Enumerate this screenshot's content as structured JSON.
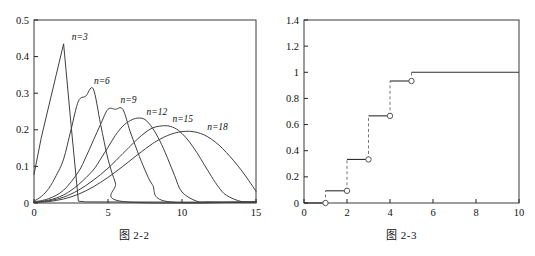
{
  "figures": [
    {
      "id": "fig-2-2",
      "caption": "图 2-2"
    },
    {
      "id": "fig-2-3",
      "caption": "图 2-3"
    }
  ],
  "chart_data": [
    {
      "type": "line",
      "title": "图 2-2",
      "xlabel": "",
      "ylabel": "",
      "xlim": [
        0,
        15
      ],
      "ylim": [
        0,
        0.5
      ],
      "xticks": [
        0,
        5,
        10,
        15
      ],
      "xtick_labels": [
        "0",
        "5",
        "10",
        "15"
      ],
      "yticks": [
        0,
        0.1,
        0.2,
        0.3,
        0.4,
        0.5
      ],
      "ytick_labels": [
        "0",
        "0.1",
        "0.2",
        "0.3",
        "0.4",
        "0.5"
      ],
      "grid": false,
      "legend": "inline-annotations",
      "annotations": [
        {
          "text": "n=3",
          "x": 2.55,
          "y": 0.445
        },
        {
          "text": "n=6",
          "x": 4.05,
          "y": 0.325
        },
        {
          "text": "n=9",
          "x": 5.85,
          "y": 0.272
        },
        {
          "text": "n=12",
          "x": 7.6,
          "y": 0.241
        },
        {
          "text": "n=15",
          "x": 9.35,
          "y": 0.221
        },
        {
          "text": "n=18",
          "x": 11.7,
          "y": 0.2
        }
      ],
      "series": [
        {
          "name": "n=3",
          "x": [
            0,
            0.5,
            1,
            1.5,
            2,
            2.5,
            3,
            3.5,
            15
          ],
          "values": [
            0.078,
            0.18,
            0.265,
            0.35,
            0.435,
            0.215,
            0.005,
            0.003,
            0.002
          ]
        },
        {
          "name": "n=6",
          "x": [
            0,
            0.5,
            1,
            1.5,
            2,
            2.5,
            3,
            3.5,
            4,
            4.5,
            5,
            5.5,
            6,
            15
          ],
          "values": [
            0.005,
            0.018,
            0.04,
            0.075,
            0.12,
            0.2,
            0.278,
            0.292,
            0.312,
            0.215,
            0.12,
            0.055,
            0.004,
            0.003
          ]
        },
        {
          "name": "n=9",
          "x": [
            0,
            1,
            2,
            3,
            3.5,
            4,
            4.5,
            5,
            5.5,
            6,
            6.5,
            7,
            7.5,
            8,
            9,
            15
          ],
          "values": [
            0.003,
            0.012,
            0.035,
            0.085,
            0.125,
            0.17,
            0.215,
            0.256,
            0.256,
            0.256,
            0.195,
            0.14,
            0.09,
            0.05,
            0.004,
            0.003
          ]
        },
        {
          "name": "n=12",
          "x": [
            0,
            1,
            2,
            3,
            4,
            4.5,
            5,
            5.5,
            6,
            6.5,
            7,
            7.5,
            8,
            8.5,
            9,
            9.5,
            10,
            11,
            12,
            15
          ],
          "values": [
            0.002,
            0.008,
            0.022,
            0.05,
            0.09,
            0.12,
            0.152,
            0.185,
            0.21,
            0.225,
            0.232,
            0.228,
            0.205,
            0.17,
            0.125,
            0.075,
            0.03,
            0.005,
            0.003,
            0.002
          ]
        },
        {
          "name": "n=15",
          "x": [
            0,
            1,
            2,
            3,
            4,
            5,
            6,
            6.5,
            7,
            7.5,
            8,
            8.5,
            9,
            9.5,
            10,
            10.5,
            11,
            11.5,
            12,
            12.5,
            13,
            14,
            15
          ],
          "values": [
            0.002,
            0.006,
            0.016,
            0.035,
            0.062,
            0.095,
            0.135,
            0.155,
            0.175,
            0.192,
            0.205,
            0.21,
            0.211,
            0.205,
            0.19,
            0.167,
            0.138,
            0.105,
            0.072,
            0.042,
            0.021,
            0.004,
            0.002
          ]
        },
        {
          "name": "n=18",
          "x": [
            0,
            1,
            2,
            3,
            4,
            5,
            6,
            7,
            8,
            8.5,
            9,
            9.5,
            10,
            10.5,
            11,
            11.5,
            12,
            12.5,
            13,
            13.5,
            14,
            14.5,
            15
          ],
          "values": [
            0.001,
            0.004,
            0.011,
            0.024,
            0.044,
            0.07,
            0.1,
            0.132,
            0.162,
            0.174,
            0.184,
            0.191,
            0.195,
            0.196,
            0.193,
            0.186,
            0.174,
            0.158,
            0.138,
            0.115,
            0.09,
            0.062,
            0.032
          ]
        }
      ]
    },
    {
      "type": "line",
      "subtype": "step-ecdf",
      "title": "图 2-3",
      "xlabel": "",
      "ylabel": "",
      "xlim": [
        0,
        10
      ],
      "ylim": [
        0,
        1.4
      ],
      "xticks": [
        0,
        2,
        4,
        6,
        8,
        10
      ],
      "xtick_labels": [
        "0",
        "2",
        "4",
        "6",
        "8",
        "10"
      ],
      "yticks": [
        0,
        0.2,
        0.4,
        0.6,
        0.8,
        1.0,
        1.2,
        1.4
      ],
      "ytick_labels": [
        "0",
        "0.2",
        "0.4",
        "0.6",
        "0.8",
        "1",
        "1.2",
        "1.4"
      ],
      "grid": false,
      "legend": "none",
      "steps": [
        {
          "x_start": 0,
          "x_end": 1,
          "y": 0.0,
          "open_circle_at_end": true
        },
        {
          "x_start": 1,
          "x_end": 2,
          "y": 0.0933,
          "open_circle_at_end": true
        },
        {
          "x_start": 2,
          "x_end": 3,
          "y": 0.3333,
          "open_circle_at_end": true
        },
        {
          "x_start": 3,
          "x_end": 4,
          "y": 0.6667,
          "open_circle_at_end": true
        },
        {
          "x_start": 4,
          "x_end": 5,
          "y": 0.9333,
          "open_circle_at_end": true
        },
        {
          "x_start": 5,
          "x_end": 10,
          "y": 1.0,
          "open_circle_at_end": false
        }
      ]
    }
  ]
}
